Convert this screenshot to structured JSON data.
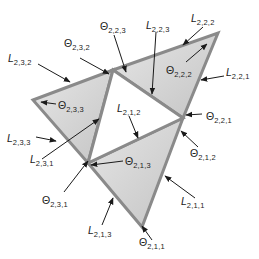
{
  "diagram": {
    "title": "",
    "colors": {
      "triangle_fill_light": "#e6e6e6",
      "triangle_fill_dark": "#c4c4c4",
      "edge_stroke": "#8a8a8a",
      "arrow": "#1a1a1a",
      "text": "#222222",
      "background": "#ffffff",
      "center_fill": "#ffffff"
    },
    "triangles": [
      {
        "id": "2,3",
        "vertices": [
          [
            33,
            100
          ],
          [
            113,
            70
          ],
          [
            88,
            163
          ]
        ]
      },
      {
        "id": "2,2",
        "vertices": [
          [
            113,
            70
          ],
          [
            218,
            33
          ],
          [
            183,
            118
          ]
        ]
      },
      {
        "id": "2,1",
        "vertices": [
          [
            88,
            163
          ],
          [
            183,
            118
          ],
          [
            142,
            227
          ]
        ]
      }
    ],
    "center_triangle": {
      "vertices": [
        [
          113,
          70
        ],
        [
          183,
          118
        ],
        [
          88,
          163
        ]
      ]
    },
    "labels": [
      {
        "id": "L232",
        "symbol": "L",
        "sub": "2,3,2",
        "x": 8,
        "y": 53,
        "arrow": [
          [
            38,
            64
          ],
          [
            70,
            82
          ]
        ]
      },
      {
        "id": "T232",
        "symbol": "Θ",
        "sub": "2,3,2",
        "x": 64,
        "y": 38,
        "arrow": [
          [
            80,
            58
          ],
          [
            109,
            74
          ]
        ]
      },
      {
        "id": "T223",
        "symbol": "Θ",
        "sub": "2,2,3",
        "x": 100,
        "y": 21,
        "arrow": [
          [
            114,
            35
          ],
          [
            126,
            72
          ]
        ]
      },
      {
        "id": "L223",
        "symbol": "L",
        "sub": "2,2,3",
        "x": 146,
        "y": 20,
        "arrow": [
          [
            156,
            32
          ],
          [
            152,
            94
          ]
        ]
      },
      {
        "id": "L222",
        "symbol": "L",
        "sub": "2,2,2",
        "x": 191,
        "y": 13,
        "arrow": [
          [
            203,
            27
          ],
          [
            183,
            45
          ]
        ]
      },
      {
        "id": "T222",
        "symbol": "Θ",
        "sub": "2,2,2",
        "x": 166,
        "y": 65,
        "arrow": [
          [
            186,
            62
          ],
          [
            207,
            44
          ]
        ]
      },
      {
        "id": "L221",
        "symbol": "L",
        "sub": "2,2,1",
        "x": 226,
        "y": 67,
        "arrow": [
          [
            224,
            76
          ],
          [
            201,
            80
          ]
        ]
      },
      {
        "id": "T221",
        "symbol": "Θ",
        "sub": "2,2,1",
        "x": 206,
        "y": 111,
        "arrow": [
          [
            202,
            114
          ],
          [
            186,
            115
          ]
        ]
      },
      {
        "id": "L212",
        "symbol": "L",
        "sub": "2,1,2",
        "x": 117,
        "y": 103,
        "arrow": [
          [
            129,
            116
          ],
          [
            138,
            138
          ]
        ]
      },
      {
        "id": "T233",
        "symbol": "Θ",
        "sub": "2,3,3",
        "x": 58,
        "y": 100,
        "arrow": [
          [
            56,
            104
          ],
          [
            41,
            102
          ]
        ]
      },
      {
        "id": "L233",
        "symbol": "L",
        "sub": "2,3,3",
        "x": 7,
        "y": 133,
        "arrow": [
          [
            36,
            137
          ],
          [
            56,
            141
          ]
        ]
      },
      {
        "id": "L231",
        "symbol": "L",
        "sub": "2,3,1",
        "x": 30,
        "y": 154,
        "arrow": [
          [
            42,
            159
          ],
          [
            99,
            119
          ]
        ]
      },
      {
        "id": "T213",
        "symbol": "Θ",
        "sub": "2,1,3",
        "x": 125,
        "y": 156,
        "arrow": [
          [
            123,
            161
          ],
          [
            91,
            165
          ]
        ]
      },
      {
        "id": "T212",
        "symbol": "Θ",
        "sub": "2,1,2",
        "x": 190,
        "y": 148,
        "arrow": [
          [
            198,
            147
          ],
          [
            181,
            131
          ]
        ]
      },
      {
        "id": "T231",
        "symbol": "Θ",
        "sub": "2,3,1",
        "x": 42,
        "y": 195,
        "arrow": [
          [
            64,
            192
          ],
          [
            88,
            161
          ]
        ]
      },
      {
        "id": "L211",
        "symbol": "L",
        "sub": "2,1,1",
        "x": 181,
        "y": 196,
        "arrow": [
          [
            195,
            198
          ],
          [
            165,
            176
          ]
        ]
      },
      {
        "id": "L213",
        "symbol": "L",
        "sub": "2,1,3",
        "x": 88,
        "y": 225,
        "arrow": [
          [
            102,
            225
          ],
          [
            113,
            198
          ]
        ]
      },
      {
        "id": "T211",
        "symbol": "Θ",
        "sub": "2,1,1",
        "x": 139,
        "y": 237,
        "arrow": [
          [
            152,
            240
          ],
          [
            142,
            226
          ]
        ]
      }
    ]
  }
}
